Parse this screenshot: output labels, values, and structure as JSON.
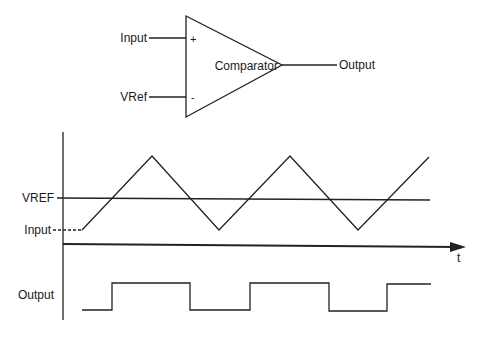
{
  "comparator": {
    "label": "Comparator",
    "input_label": "Input",
    "vref_label": "VRef",
    "output_label": "Output",
    "plus_sign": "+",
    "minus_sign": "-"
  },
  "waveforms": {
    "vref_label": "VREF",
    "input_label": "Input",
    "time_label": "t",
    "output_label": "Output"
  }
}
